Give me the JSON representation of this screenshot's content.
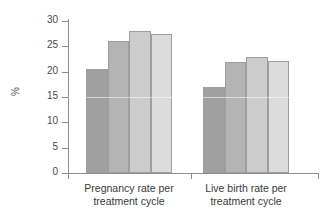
{
  "chart_data": {
    "type": "bar",
    "title": "",
    "xlabel": "",
    "ylabel": "%",
    "ylim": [
      0,
      30
    ],
    "yticks": [
      0,
      5,
      10,
      15,
      20,
      25,
      30
    ],
    "ytick_labels": [
      "0",
      "5",
      "10",
      "15",
      "20",
      "25",
      "30"
    ],
    "grid": false,
    "legend": "none",
    "categories": [
      "Pregnancy rate per treatment cycle",
      "Live birth rate per treatment cycle"
    ],
    "category_lines": [
      [
        "Pregnancy rate per",
        "treatment cycle"
      ],
      [
        "Live birth rate per",
        "treatment cycle"
      ]
    ],
    "series": [
      {
        "name": "Series 1",
        "color": "#a0a0a0",
        "values": [
          20.5,
          17.0
        ]
      },
      {
        "name": "Series 2",
        "color": "#b4b4b4",
        "values": [
          26.0,
          21.9
        ]
      },
      {
        "name": "Series 3",
        "color": "#cccccc",
        "values": [
          28.0,
          22.9
        ]
      },
      {
        "name": "Series 4",
        "color": "#dcdcdc",
        "values": [
          27.5,
          22.1
        ]
      }
    ],
    "axis_color": "#8d8d8d",
    "bar_edge_color": "#9e9e9e",
    "background": "#ffffff"
  }
}
